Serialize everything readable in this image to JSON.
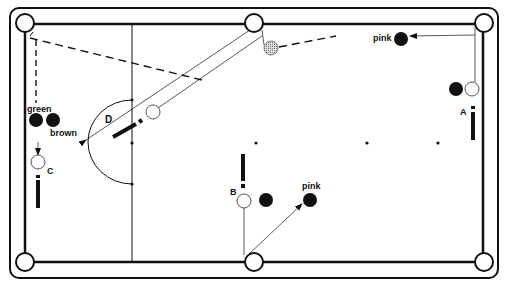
{
  "diagram": {
    "labels": {
      "pink_top": "pink",
      "pink_bottom": "pink",
      "green": "green",
      "brown": "brown",
      "position_a": "A",
      "position_b": "B",
      "position_c": "C",
      "position_d": "D"
    },
    "colors": {
      "line": "#111111",
      "background": "#ffffff",
      "shaded_ball": "#bbbbbb"
    }
  }
}
